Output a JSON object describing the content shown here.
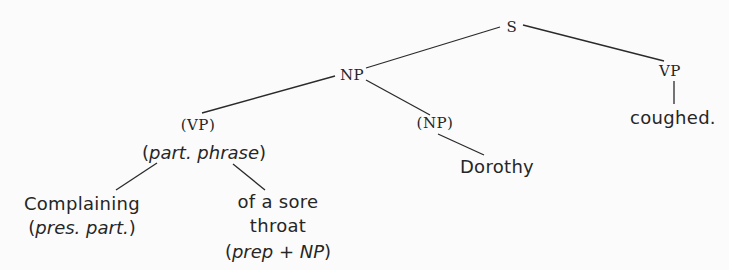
{
  "diagram": {
    "type": "syntax-tree",
    "sentence": "Complaining of a sore throat Dorothy coughed.",
    "nodes": {
      "s": {
        "label": "S",
        "x": 512,
        "y": 27
      },
      "np_top": {
        "label": "NP",
        "x": 352,
        "y": 75
      },
      "vp_right": {
        "label": "VP",
        "x": 670,
        "y": 71
      },
      "coughed": {
        "label": "coughed.",
        "x": 673,
        "y": 118
      },
      "vp_paren": {
        "label": "(VP)",
        "x": 198,
        "y": 125
      },
      "part_phrase": {
        "open": "(",
        "italic": "part. phrase",
        "close": ")",
        "x": 204,
        "y": 153
      },
      "np_paren": {
        "label": "(NP)",
        "x": 435,
        "y": 123
      },
      "dorothy": {
        "label": "Dorothy",
        "x": 497,
        "y": 167
      },
      "complaining": {
        "label": "Complaining",
        "x": 82,
        "y": 204
      },
      "pres_part": {
        "open": "(",
        "italic": "pres. part.",
        "close": ")",
        "x": 82,
        "y": 228
      },
      "of_a_sore": {
        "label": "of a sore",
        "x": 278,
        "y": 202
      },
      "throat": {
        "label": "throat",
        "x": 278,
        "y": 226
      },
      "prep_np": {
        "open": "(",
        "italic": "prep + NP",
        "close": ")",
        "x": 278,
        "y": 252
      }
    },
    "edges": [
      {
        "from": "s",
        "to": "np_top",
        "x1": 500,
        "y1": 27,
        "x2": 366,
        "y2": 68
      },
      {
        "from": "s",
        "to": "vp_right",
        "x1": 523,
        "y1": 25,
        "x2": 664,
        "y2": 61
      },
      {
        "from": "np_top",
        "to": "vp_paren",
        "x1": 335,
        "y1": 76,
        "x2": 202,
        "y2": 113
      },
      {
        "from": "np_top",
        "to": "np_paren",
        "x1": 366,
        "y1": 80,
        "x2": 430,
        "y2": 115
      },
      {
        "from": "vp_right",
        "to": "coughed",
        "x1": 674,
        "y1": 81,
        "x2": 674,
        "y2": 104
      },
      {
        "from": "np_paren",
        "to": "dorothy",
        "x1": 438,
        "y1": 134,
        "x2": 484,
        "y2": 155
      },
      {
        "from": "part_phrase",
        "to": "complaining",
        "x1": 157,
        "y1": 163,
        "x2": 116,
        "y2": 190
      },
      {
        "from": "part_phrase",
        "to": "of_a_sore",
        "x1": 233,
        "y1": 164,
        "x2": 265,
        "y2": 190
      }
    ],
    "colors": {
      "ink": "#262626",
      "background": "#fbfbfb"
    }
  }
}
